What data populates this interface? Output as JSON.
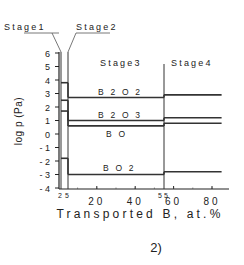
{
  "figure_label": "2)",
  "chart_data": {
    "type": "line",
    "title": "",
    "xlabel": "Transported B, at.%",
    "ylabel": "log p (Pa)",
    "xlim": [
      0,
      90
    ],
    "ylim": [
      -4,
      6
    ],
    "x_ticks": [
      {
        "value": 2,
        "label": "2",
        "small": true
      },
      {
        "value": 5,
        "label": "5",
        "small": true
      },
      {
        "value": 20,
        "label": "20"
      },
      {
        "value": 40,
        "label": "40"
      },
      {
        "value": 55,
        "label": "55",
        "small": true
      },
      {
        "value": 60,
        "label": "60"
      },
      {
        "value": 80,
        "label": "80"
      }
    ],
    "y_ticks": [
      6,
      5,
      4,
      3,
      2,
      1,
      0,
      -1,
      -2,
      -3,
      -4
    ],
    "y_tick_labels": [
      "6",
      "5",
      "4",
      "3",
      "2",
      "1",
      "0",
      "- 1",
      "- 2",
      "- 3",
      "- 4"
    ],
    "grid": false,
    "stages": [
      {
        "name": "Stage1",
        "x_start": 0,
        "x_end": 2
      },
      {
        "name": "Stage2",
        "x_start": 2,
        "x_end": 5
      },
      {
        "name": "Stage3",
        "x_start": 5,
        "x_end": 55
      },
      {
        "name": "Stage4",
        "x_start": 55,
        "x_end": 85
      }
    ],
    "series": [
      {
        "name": "B2O2",
        "label": "B 2 O 2",
        "segments": [
          {
            "x": [
              2,
              5
            ],
            "y": 3.8
          },
          {
            "x": [
              5,
              55
            ],
            "y": 2.7
          },
          {
            "x": [
              55,
              85
            ],
            "y": 2.9
          }
        ]
      },
      {
        "name": "B2O3",
        "label": "B 2 O 3",
        "segments": [
          {
            "x": [
              2,
              5
            ],
            "y": 2.5
          },
          {
            "x": [
              5,
              55
            ],
            "y": 1.0
          },
          {
            "x": [
              55,
              85
            ],
            "y": 1.2
          }
        ]
      },
      {
        "name": "BO",
        "label": "B O",
        "segments": [
          {
            "x": [
              2,
              5
            ],
            "y": 1.7
          },
          {
            "x": [
              5,
              55
            ],
            "y": 0.6
          },
          {
            "x": [
              55,
              85
            ],
            "y": 0.8
          }
        ]
      },
      {
        "name": "BO2",
        "label": "B O 2",
        "segments": [
          {
            "x": [
              2,
              5
            ],
            "y": -1.8
          },
          {
            "x": [
              5,
              55
            ],
            "y": -3.0
          },
          {
            "x": [
              55,
              85
            ],
            "y": -2.8
          }
        ]
      }
    ]
  }
}
